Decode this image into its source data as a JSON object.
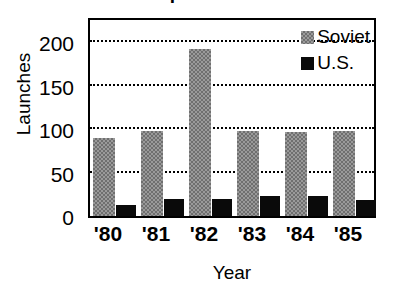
{
  "chart_data": {
    "type": "bar",
    "title": "Space Launches",
    "xlabel": "Year",
    "ylabel": "Launches",
    "categories": [
      "'80",
      "'81",
      "'82",
      "'83",
      "'84",
      "'85"
    ],
    "series": [
      {
        "name": "Soviet",
        "color": "#808080",
        "values": [
          90,
          98,
          192,
          98,
          97,
          98
        ]
      },
      {
        "name": "U.S.",
        "color": "#000000",
        "values": [
          13,
          19,
          19,
          23,
          23,
          18
        ]
      }
    ],
    "ylim": [
      0,
      230
    ],
    "yticks": [
      0,
      50,
      100,
      150,
      200
    ],
    "ytick_labels": [
      "0",
      "50",
      "100",
      "150",
      "200"
    ],
    "grid": true,
    "grid_style": "dotted",
    "legend_position": "top-right",
    "frame": true
  },
  "legend": {
    "entries": [
      {
        "label": "Soviet",
        "swatch": "gray-square-icon"
      },
      {
        "label": "U.S.",
        "swatch": "black-square-icon"
      }
    ]
  }
}
